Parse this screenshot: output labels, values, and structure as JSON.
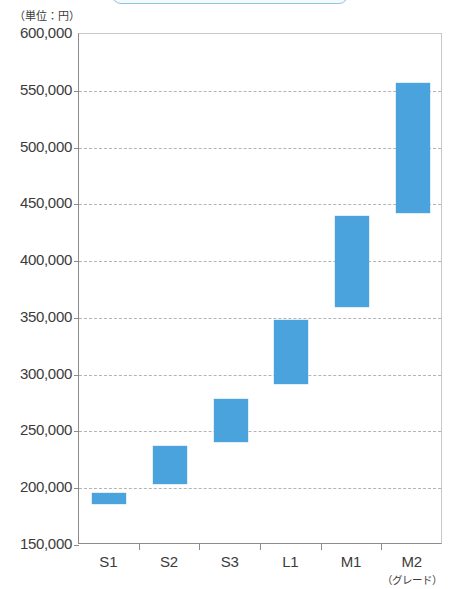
{
  "title_capsule": {
    "text": "グレード別 価格帯"
  },
  "unit_note": "（単位：円）",
  "axis_name": "（グレード）",
  "colors": {
    "bar": "#4ba3dd",
    "grid": "#b4b4b4",
    "axis": "#8c8c8c",
    "text": "#3b3b3b",
    "capsule_border": "#8fc4e0"
  },
  "chart_data": {
    "type": "bar",
    "subtype": "floating-range-bar",
    "title": "グレード別 価格帯",
    "xlabel": "（グレード）",
    "ylabel": "（単位：円）",
    "ylim": [
      150000,
      600000
    ],
    "ytick_step": 50000,
    "yticks": [
      600000,
      550000,
      500000,
      450000,
      400000,
      350000,
      300000,
      250000,
      200000,
      150000
    ],
    "ytick_labels": [
      "600,000",
      "550,000",
      "500,000",
      "450,000",
      "400,000",
      "350,000",
      "300,000",
      "250,000",
      "200,000",
      "150,000"
    ],
    "grid": true,
    "grid_style": "dashed-horizontal",
    "legend": false,
    "categories": [
      "S1",
      "S2",
      "S3",
      "L1",
      "M1",
      "M2"
    ],
    "series": [
      {
        "name": "価格帯",
        "low": [
          186000,
          204000,
          241000,
          292000,
          360000,
          442000
        ],
        "high": [
          196000,
          237000,
          279000,
          348000,
          440000,
          557000
        ]
      }
    ],
    "bars": [
      {
        "category": "S1",
        "low": 186000,
        "high": 196000
      },
      {
        "category": "S2",
        "low": 204000,
        "high": 237000
      },
      {
        "category": "S3",
        "low": 241000,
        "high": 279000
      },
      {
        "category": "L1",
        "low": 292000,
        "high": 348000
      },
      {
        "category": "M1",
        "low": 360000,
        "high": 440000
      },
      {
        "category": "M2",
        "low": 442000,
        "high": 557000
      }
    ]
  }
}
